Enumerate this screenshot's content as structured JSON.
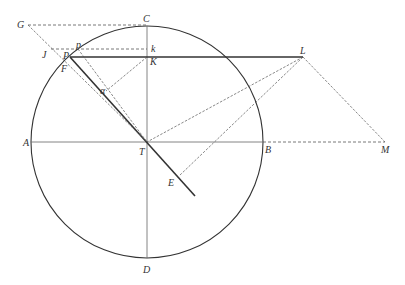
{
  "diagram": {
    "type": "geometric-construction",
    "colors": {
      "line": "#333333",
      "dashed": "#555555",
      "background": "#ffffff"
    },
    "circle": {
      "cx": 147,
      "cy": 142,
      "r": 116
    },
    "points": {
      "C": {
        "label": "C",
        "x": 147,
        "y": 26
      },
      "G": {
        "label": "G",
        "x": 28,
        "y": 25
      },
      "J": {
        "label": "J",
        "x": 51,
        "y": 49
      },
      "p": {
        "label": "p",
        "x": 78,
        "y": 49
      },
      "k": {
        "label": "k",
        "x": 147,
        "y": 49
      },
      "P": {
        "label": "P",
        "x": 70,
        "y": 57
      },
      "K": {
        "label": "K",
        "x": 147,
        "y": 57
      },
      "F": {
        "label": "F",
        "x": 64,
        "y": 64
      },
      "alpha": {
        "label": "α",
        "x": 106,
        "y": 91
      },
      "A": {
        "label": "A",
        "x": 31,
        "y": 142
      },
      "T": {
        "label": "T",
        "x": 147,
        "y": 142
      },
      "B": {
        "label": "B",
        "x": 263,
        "y": 142
      },
      "M": {
        "label": "M",
        "x": 385,
        "y": 142
      },
      "L": {
        "label": "L",
        "x": 303,
        "y": 57
      },
      "E": {
        "label": "E",
        "x": 179,
        "y": 176
      },
      "D": {
        "label": "D",
        "x": 147,
        "y": 258
      }
    },
    "labels": {
      "C": "C",
      "G": "G",
      "J": "J",
      "p": "p",
      "k": "k",
      "P": "P",
      "K": "K",
      "F": "F",
      "alpha": "α",
      "A": "A",
      "T": "T",
      "B": "B",
      "M": "M",
      "L": "L",
      "E": "E",
      "D": "D"
    },
    "segments": [
      {
        "from": "A",
        "to": "B",
        "style": "solid"
      },
      {
        "from": "B",
        "to": "M",
        "style": "dashed"
      },
      {
        "from": "C",
        "to": "D",
        "style": "solid"
      },
      {
        "from": "P",
        "to": "L",
        "style": "solid-thick"
      },
      {
        "from": "P",
        "to": "T-extended",
        "style": "solid-thick"
      },
      {
        "from": "G",
        "to": "C",
        "style": "dashed"
      },
      {
        "from": "J",
        "to": "k",
        "style": "dashed"
      },
      {
        "from": "G",
        "to": "T",
        "style": "dashed"
      },
      {
        "from": "p",
        "to": "T",
        "style": "dashed"
      },
      {
        "from": "K",
        "to": "alpha",
        "style": "dashed"
      },
      {
        "from": "L",
        "to": "T",
        "style": "dashed"
      },
      {
        "from": "L",
        "to": "E",
        "style": "dashed"
      },
      {
        "from": "L",
        "to": "M",
        "style": "dashed"
      }
    ]
  }
}
